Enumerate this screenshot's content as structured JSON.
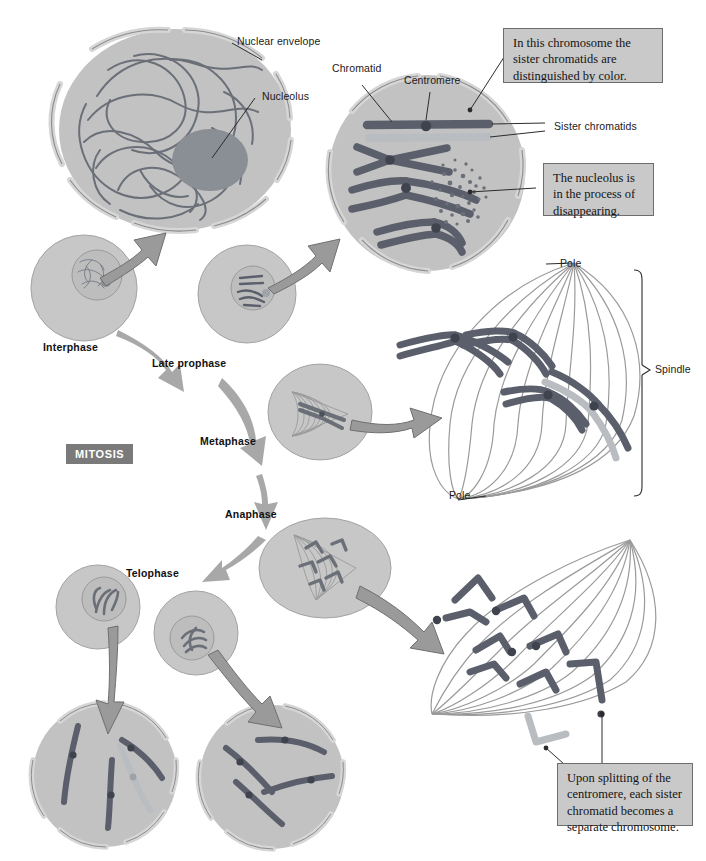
{
  "figure": {
    "title": "Mitosis",
    "badge_label": "MITOSIS",
    "background_color": "#ffffff"
  },
  "colors": {
    "cell_fill": "#c2c2c2",
    "cell_stroke": "#8d8d8d",
    "nucleus_fill": "#bdbdbd",
    "nucleolus_fill": "#8a8f95",
    "chromatin_stroke": "#6a6f78",
    "chromosome_dark": "#5a5f6b",
    "chromosome_light": "#b9bdc1",
    "spindle_fiber": "#9a9a9a",
    "arrow_fill": "#9a9a9a",
    "callout_fill": "#c9c9c9",
    "callout_border": "#6d6d6d",
    "badge_fill": "#7a7a7a",
    "leader_line": "#2b2b2b"
  },
  "leader_labels": [
    {
      "id": "nuclear-envelope",
      "text": "Nuclear envelope"
    },
    {
      "id": "nucleolus",
      "text": "Nucleolus"
    },
    {
      "id": "chromatid",
      "text": "Chromatid"
    },
    {
      "id": "centromere",
      "text": "Centromere"
    },
    {
      "id": "sister-chromatids",
      "text": "Sister chromatids"
    },
    {
      "id": "pole-top",
      "text": "Pole"
    },
    {
      "id": "pole-bottom",
      "text": "Pole"
    },
    {
      "id": "spindle",
      "text": "Spindle"
    }
  ],
  "phases": [
    {
      "id": "interphase",
      "label": "Interphase"
    },
    {
      "id": "late-prophase",
      "label": "Late prophase"
    },
    {
      "id": "metaphase",
      "label": "Metaphase"
    },
    {
      "id": "anaphase",
      "label": "Anaphase"
    },
    {
      "id": "telophase",
      "label": "Telophase"
    }
  ],
  "callouts": [
    {
      "id": "chromatid-color",
      "text": "In this chromosome the sister chromatids are distinguished by color."
    },
    {
      "id": "nucleolus-disappearing",
      "text": "The nucleolus is in the process of disappearing."
    },
    {
      "id": "centromere-splitting",
      "text": "Upon splitting of the centromere, each sister chromatid becomes a separate chromosome."
    }
  ],
  "cells": {
    "interphase_large": {
      "name": "Interphase cell (magnified)",
      "chromosome_count": 0
    },
    "late_prophase_large": {
      "name": "Late prophase cell (magnified)",
      "chromosome_count": 4
    },
    "metaphase_spindle": {
      "name": "Metaphase spindle (magnified)",
      "chromosome_count": 4
    },
    "anaphase_spindle": {
      "name": "Anaphase spindle (magnified)",
      "chromosome_count": 8
    },
    "daughter_left": {
      "name": "Daughter cell (left)",
      "chromosome_count": 4
    },
    "daughter_right": {
      "name": "Daughter cell (right)",
      "chromosome_count": 4
    }
  }
}
